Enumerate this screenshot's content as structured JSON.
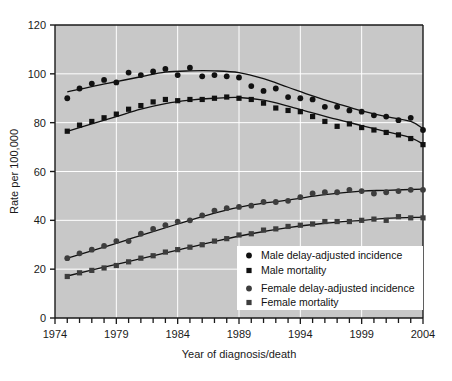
{
  "chart_data": {
    "type": "line",
    "title": "",
    "xlabel": "Year of diagnosis/death",
    "ylabel": "Rate per 100,000",
    "xlim": [
      1974,
      2004
    ],
    "ylim": [
      0,
      120
    ],
    "ytick_step": 20,
    "xtick_step": 1,
    "xtick_label_step": 5,
    "grid": true,
    "grid_color": "#ffffff",
    "plot_background": "#c8c8c8",
    "legend_position": "bottom-right",
    "ytick_labels": [
      "0",
      "20",
      "40",
      "60",
      "80",
      "100",
      "120"
    ],
    "xtick_labels": [
      "1974",
      "1979",
      "1984",
      "1989",
      "1994",
      "1999",
      "2004"
    ],
    "x": [
      1975,
      1976,
      1977,
      1978,
      1979,
      1980,
      1981,
      1982,
      1983,
      1984,
      1985,
      1986,
      1987,
      1988,
      1989,
      1990,
      1991,
      1992,
      1993,
      1994,
      1995,
      1996,
      1997,
      1998,
      1999,
      2000,
      2001,
      2002,
      2003,
      2004
    ],
    "series": [
      {
        "name": "Male delay-adjusted incidence",
        "marker": "circle",
        "color": "#111111",
        "values": [
          90.0,
          94.0,
          96.0,
          97.5,
          96.5,
          100.5,
          99.5,
          101.0,
          102.0,
          99.5,
          102.5,
          99.0,
          99.5,
          99.0,
          98.5,
          95.0,
          93.0,
          94.0,
          90.5,
          90.0,
          89.5,
          86.5,
          86.5,
          85.0,
          84.5,
          83.0,
          82.5,
          81.0,
          82.0,
          77.0
        ]
      },
      {
        "name": "Male mortality",
        "marker": "square",
        "color": "#111111",
        "values": [
          76.5,
          79.0,
          80.5,
          82.0,
          83.5,
          85.5,
          87.0,
          88.5,
          89.5,
          89.0,
          89.5,
          89.5,
          90.0,
          90.5,
          90.0,
          89.5,
          88.0,
          86.0,
          85.0,
          84.5,
          82.5,
          80.5,
          78.5,
          79.5,
          78.0,
          77.0,
          76.0,
          75.0,
          73.5,
          71.0
        ]
      },
      {
        "name": "Female delay-adjusted incidence",
        "marker": "circle",
        "color": "#3d3d3d",
        "values": [
          24.5,
          26.5,
          28.0,
          29.5,
          31.5,
          31.5,
          34.5,
          36.5,
          38.0,
          39.5,
          40.0,
          42.0,
          44.0,
          45.0,
          45.5,
          46.0,
          47.5,
          47.5,
          48.0,
          49.5,
          51.0,
          51.5,
          51.5,
          52.5,
          52.0,
          51.0,
          51.5,
          52.0,
          52.5,
          52.5
        ]
      },
      {
        "name": "Female mortality",
        "marker": "square",
        "color": "#3d3d3d",
        "values": [
          17.0,
          18.5,
          19.5,
          20.5,
          21.5,
          23.0,
          24.5,
          25.5,
          27.0,
          28.0,
          29.0,
          30.0,
          31.5,
          32.5,
          34.0,
          34.5,
          36.0,
          36.5,
          37.5,
          38.0,
          38.5,
          39.5,
          39.5,
          39.5,
          40.0,
          40.5,
          40.0,
          41.5,
          41.0,
          41.0
        ]
      }
    ],
    "trend_lines": [
      {
        "name": "Male delay-adjusted incidence trend",
        "points": [
          [
            1975,
            92.6
          ],
          [
            1977,
            94.8
          ],
          [
            1979,
            96.8
          ],
          [
            1981,
            98.8
          ],
          [
            1983,
            100.7
          ],
          [
            1985,
            101.2
          ],
          [
            1987,
            101.2
          ],
          [
            1989,
            100.5
          ],
          [
            1991,
            98.0
          ],
          [
            1993,
            94.5
          ],
          [
            1995,
            91.0
          ],
          [
            1997,
            87.8
          ],
          [
            1999,
            84.8
          ],
          [
            2001,
            82.5
          ],
          [
            2003,
            80.5
          ],
          [
            2004,
            77.5
          ]
        ]
      },
      {
        "name": "Male mortality trend",
        "points": [
          [
            1975,
            76.4
          ],
          [
            1977,
            79.5
          ],
          [
            1979,
            82.5
          ],
          [
            1981,
            85.5
          ],
          [
            1983,
            87.8
          ],
          [
            1985,
            89.2
          ],
          [
            1987,
            90.0
          ],
          [
            1989,
            90.3
          ],
          [
            1991,
            89.2
          ],
          [
            1993,
            86.8
          ],
          [
            1995,
            84.0
          ],
          [
            1997,
            81.3
          ],
          [
            1999,
            78.8
          ],
          [
            2001,
            76.3
          ],
          [
            2003,
            73.8
          ],
          [
            2004,
            71.2
          ]
        ]
      },
      {
        "name": "Female delay-adjusted incidence trend",
        "points": [
          [
            1975,
            24.5
          ],
          [
            1978,
            29.0
          ],
          [
            1981,
            33.8
          ],
          [
            1984,
            38.5
          ],
          [
            1987,
            43.0
          ],
          [
            1990,
            46.3
          ],
          [
            1993,
            48.3
          ],
          [
            1996,
            50.5
          ],
          [
            1999,
            52.0
          ],
          [
            2001,
            52.3
          ],
          [
            2004,
            52.8
          ]
        ]
      },
      {
        "name": "Female mortality trend",
        "points": [
          [
            1975,
            17.2
          ],
          [
            1978,
            20.8
          ],
          [
            1981,
            24.3
          ],
          [
            1984,
            27.8
          ],
          [
            1987,
            31.3
          ],
          [
            1990,
            34.5
          ],
          [
            1993,
            37.0
          ],
          [
            1996,
            38.8
          ],
          [
            1999,
            40.0
          ],
          [
            2001,
            40.8
          ],
          [
            2004,
            41.3
          ]
        ]
      }
    ],
    "legend": [
      {
        "label": "Male delay-adjusted incidence",
        "marker": "circle",
        "color": "#111111"
      },
      {
        "label": "Male mortality",
        "marker": "square",
        "color": "#111111"
      },
      {
        "label": "Female delay-adjusted incidence",
        "marker": "circle",
        "color": "#3d3d3d"
      },
      {
        "label": "Female mortality",
        "marker": "square",
        "color": "#3d3d3d"
      }
    ]
  }
}
